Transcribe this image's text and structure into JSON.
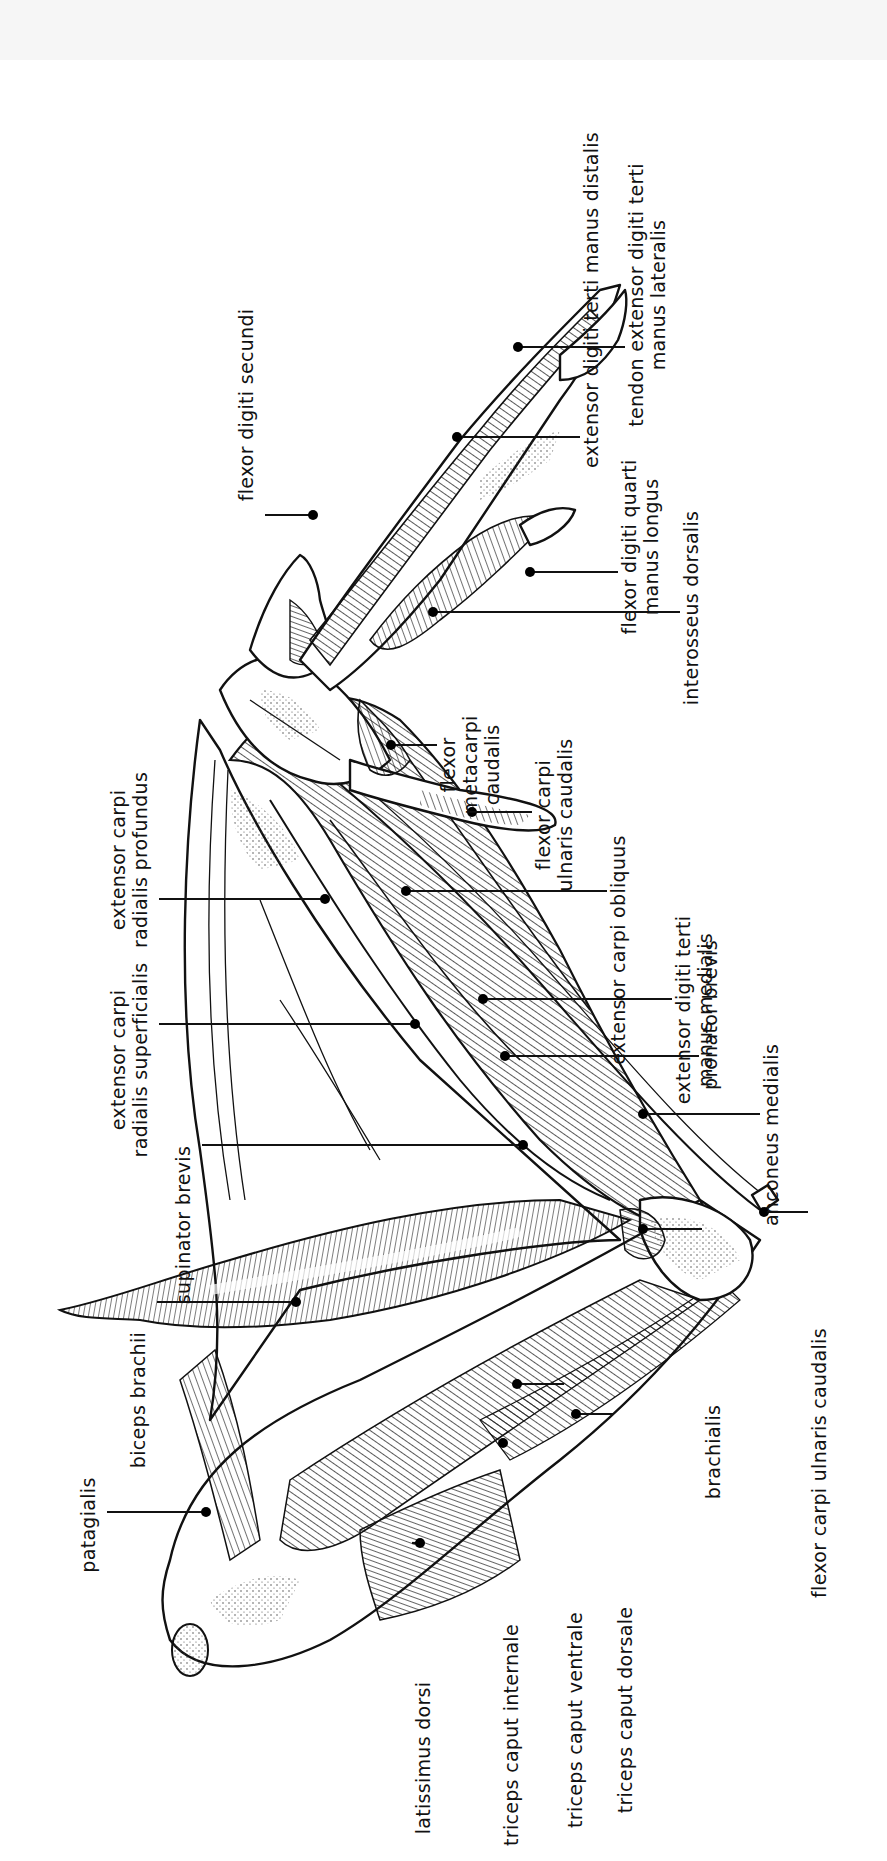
{
  "figure": {
    "orientation": "rotated 90° counter-clockwise",
    "line_color": "#111111",
    "background": "#ffffff"
  },
  "labels": [
    {
      "id": "extensor-digiti-terti-manus-distalis",
      "lines": [
        "extensor digiti terti manus distalis"
      ],
      "x": 598,
      "y": 300,
      "dot": [
        457,
        437
      ]
    },
    {
      "id": "tendon-extensor-digiti-terti-manus-lateralis",
      "lines": [
        "tendon extensor digiti terti",
        "manus lateralis"
      ],
      "x": 643,
      "y": 295,
      "dot": [
        518,
        347
      ]
    },
    {
      "id": "flexor-digiti-secundi",
      "lines": [
        "flexor digiti secundi"
      ],
      "x": 253,
      "y": 405,
      "dot": [
        313,
        515
      ]
    },
    {
      "id": "flexor-digiti-quarti-manus-longus",
      "lines": [
        "flexor digiti quarti",
        "manus longus"
      ],
      "x": 636,
      "y": 547,
      "dot": [
        530,
        572
      ]
    },
    {
      "id": "interosseus-dorsalis",
      "lines": [
        "interosseus dorsalis"
      ],
      "x": 698,
      "y": 608,
      "dot": [
        433,
        612
      ]
    },
    {
      "id": "flexor-metacarpi-caudalis",
      "lines": [
        "flexor",
        "metacarpi",
        "caudalis"
      ],
      "x": 455,
      "y": 765,
      "dot": [
        391,
        745
      ]
    },
    {
      "id": "flexor-carpi-ulnaris-caudalis",
      "lines": [
        "flexor carpi",
        "ulnaris caudalis"
      ],
      "x": 550,
      "y": 815,
      "dot": [
        472,
        812
      ]
    },
    {
      "id": "extensor-carpi-radialis-profundus",
      "lines": [
        "extensor carpi",
        "radialis profundus"
      ],
      "x": 125,
      "y": 860,
      "dot": [
        325,
        899
      ]
    },
    {
      "id": "extensor-carpi-obliquus",
      "lines": [
        "extensor carpi obliquus"
      ],
      "x": 625,
      "y": 950,
      "dot": [
        406,
        891
      ]
    },
    {
      "id": "extensor-digiti-terti-manus-medialis",
      "lines": [
        "extensor digiti terti",
        "manus medialis"
      ],
      "x": 690,
      "y": 1010,
      "dot": [
        483,
        999
      ]
    },
    {
      "id": "extensor-carpi-radialis-superficialis",
      "lines": [
        "extensor carpi",
        "radialis superficialis"
      ],
      "x": 125,
      "y": 1060,
      "dot": [
        415,
        1024
      ]
    },
    {
      "id": "pronator-brevis",
      "lines": [
        "pronator brevis"
      ],
      "x": 717,
      "y": 1015,
      "dot": [
        505,
        1056
      ]
    },
    {
      "id": "anconeus-medialis",
      "lines": [
        "anconeus medialis"
      ],
      "x": 778,
      "y": 1135,
      "dot": [
        643,
        1114
      ]
    },
    {
      "id": "supinator-brevis",
      "lines": [
        "supinator brevis"
      ],
      "x": 190,
      "y": 1225,
      "dot": [
        523,
        1145
      ]
    },
    {
      "id": "biceps-brachii",
      "lines": [
        "biceps brachii"
      ],
      "x": 145,
      "y": 1400,
      "dot": [
        296,
        1302
      ]
    },
    {
      "id": "patagialis",
      "lines": [
        "patagialis"
      ],
      "x": 95,
      "y": 1525,
      "dot": [
        206,
        1512
      ]
    },
    {
      "id": "brachialis",
      "lines": [
        "brachialis"
      ],
      "x": 720,
      "y": 1452,
      "dot": [
        643,
        1229
      ]
    },
    {
      "id": "triceps-caput-internale",
      "lines": [
        "triceps caput internale"
      ],
      "x": 518,
      "y": 1735,
      "dot": [
        503,
        1443
      ]
    },
    {
      "id": "triceps-caput-ventrale",
      "lines": [
        "triceps caput ventrale"
      ],
      "x": 582,
      "y": 1720,
      "dot": [
        517,
        1384
      ]
    },
    {
      "id": "triceps-caput-dorsale",
      "lines": [
        "triceps caput dorsale"
      ],
      "x": 632,
      "y": 1710,
      "dot": [
        576,
        1414
      ]
    },
    {
      "id": "latissimus-dorsi",
      "lines": [
        "latissimus dorsi"
      ],
      "x": 430,
      "y": 1758,
      "dot": [
        420,
        1543
      ]
    },
    {
      "id": "flexor-carpi-ulnaris-caudalis-elbow",
      "lines": [
        "flexor carpi ulnaris caudalis"
      ],
      "x": 826,
      "y": 1463,
      "dot": [
        764,
        1212
      ]
    }
  ]
}
